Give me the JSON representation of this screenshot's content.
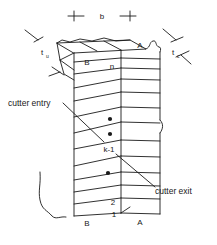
{
  "figure": {
    "type": "engineering-diagram"
  },
  "dimension": {
    "width_label": "b"
  },
  "thickness": {
    "uncut": {
      "base": "t",
      "sub": "u"
    },
    "chip": {
      "base": "t",
      "sub": "c"
    }
  },
  "faces": {
    "front_top": "B",
    "front_bottom": "B",
    "side_top": "A",
    "side_bottom": "A"
  },
  "layers": {
    "top_label": "n",
    "middle_label": "k-1",
    "second_label": "2",
    "first_label": "1",
    "ellipsis_dots": 3
  },
  "annotations": {
    "entry": "cutter entry",
    "exit": "cutter exit"
  },
  "colors": {
    "line": "#1a1a1a",
    "text": "#1a1a1a",
    "background": "#ffffff"
  }
}
